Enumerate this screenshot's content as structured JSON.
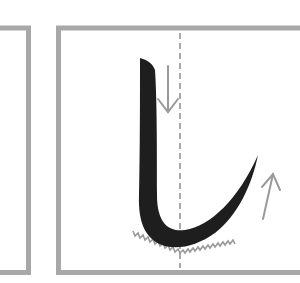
{
  "diagram": {
    "character": "し",
    "colors": {
      "background": "#ffffff",
      "box_border": "#a8a8a8",
      "guide_line": "#a8a8a8",
      "stroke": "#1e1e1e",
      "arrow": "#9a9a9a",
      "zigzag": "#9a9a9a"
    },
    "panels": [
      {
        "id": "previous-panel",
        "visible": "partial"
      },
      {
        "id": "current-panel",
        "visible": "partial"
      }
    ],
    "annotations": [
      {
        "type": "arrow",
        "direction": "down"
      },
      {
        "type": "arrow",
        "direction": "up"
      },
      {
        "type": "zigzag",
        "meaning": "brush-pressure-at-curve"
      },
      {
        "type": "dashed-centerline"
      }
    ]
  }
}
